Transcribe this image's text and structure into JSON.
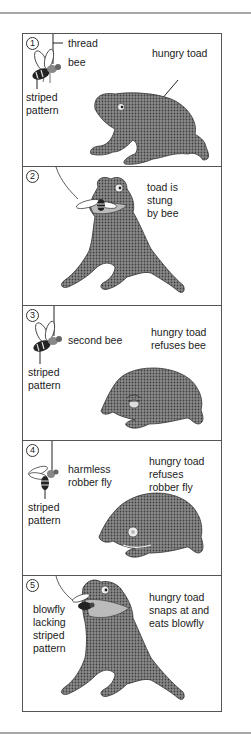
{
  "figure": {
    "panels": [
      {
        "number": "1",
        "labels": {
          "thread": "thread",
          "bee": "bee",
          "striped_line1": "striped",
          "striped_line2": "pattern",
          "toad": "hungry toad"
        }
      },
      {
        "number": "2",
        "labels": {
          "caption_line1": "toad is",
          "caption_line2": "stung",
          "caption_line3": "by bee"
        }
      },
      {
        "number": "3",
        "labels": {
          "bee": "second bee",
          "striped_line1": "striped",
          "striped_line2": "pattern",
          "caption_line1": "hungry toad",
          "caption_line2": "refuses bee"
        }
      },
      {
        "number": "4",
        "labels": {
          "fly_line1": "harmless",
          "fly_line2": "robber fly",
          "striped_line1": "striped",
          "striped_line2": "pattern",
          "caption_line1": "hungry toad",
          "caption_line2": "refuses",
          "caption_line3": "robber fly"
        }
      },
      {
        "number": "5",
        "labels": {
          "fly_line1": "blowfly",
          "fly_line2": "lacking",
          "fly_line3": "striped",
          "fly_line4": "pattern",
          "caption_line1": "hungry toad",
          "caption_line2": "snaps at and",
          "caption_line3": "eats blowfly"
        }
      }
    ],
    "colors": {
      "toad_fill": "#7a7a7a",
      "toad_dots": "#4a4a4a",
      "rule": "#a8a8a8",
      "border": "#555555"
    }
  }
}
